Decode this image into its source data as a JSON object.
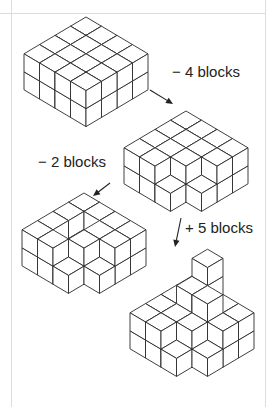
{
  "style": {
    "stroke": "#2a2a2a",
    "fill": "#ffffff",
    "frame": "#dcdcdc"
  },
  "projection": {
    "r": [
      15.5,
      9.2
    ],
    "l": [
      -15.5,
      9.2
    ],
    "h": 18
  },
  "steps": [
    {
      "label": "",
      "origin": [
        86,
        53
      ],
      "heights": [
        [
          2,
          2,
          2,
          2
        ],
        [
          2,
          2,
          2,
          2
        ],
        [
          2,
          2,
          2,
          2
        ],
        [
          2,
          2,
          2,
          2
        ]
      ]
    },
    {
      "label": "− 4 blocks",
      "origin": [
        186,
        147
      ],
      "heights": [
        [
          2,
          2,
          2,
          2
        ],
        [
          2,
          2,
          2,
          2
        ],
        [
          2,
          2,
          2,
          1
        ],
        [
          2,
          2,
          1,
          0
        ]
      ]
    },
    {
      "label": "− 2 blocks",
      "origin": [
        84,
        229
      ],
      "heights": [
        [
          2,
          2,
          2,
          2
        ],
        [
          2,
          1,
          1,
          2
        ],
        [
          2,
          2,
          2,
          1
        ],
        [
          2,
          2,
          1,
          0
        ]
      ]
    },
    {
      "label": "+ 5 blocks",
      "origin": [
        192,
        312
      ],
      "heights": [
        [
          2,
          2,
          2,
          2
        ],
        [
          4,
          3,
          2,
          2
        ],
        [
          2,
          3,
          2,
          1
        ],
        [
          2,
          2,
          1,
          0
        ]
      ]
    }
  ],
  "arrows": [
    {
      "from": [
        150,
        90
      ],
      "to": [
        173,
        104
      ]
    },
    {
      "from": [
        110,
        183
      ],
      "to": [
        93,
        196
      ]
    },
    {
      "from": [
        181,
        218
      ],
      "to": [
        175,
        247
      ]
    }
  ],
  "labels": [
    {
      "text": "− 4 blocks",
      "x": 172,
      "y": 72
    },
    {
      "text": "− 2 blocks",
      "x": 38,
      "y": 162
    },
    {
      "text": "+ 5 blocks",
      "x": 185,
      "y": 228
    }
  ]
}
